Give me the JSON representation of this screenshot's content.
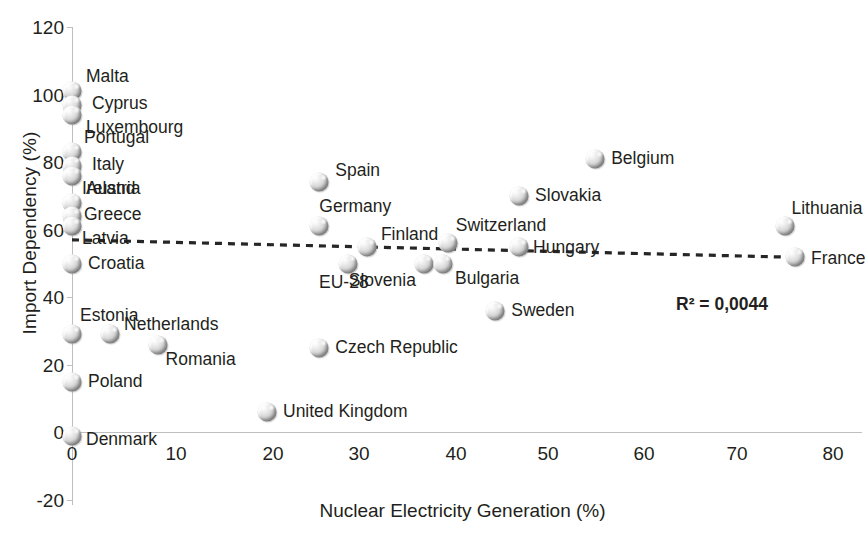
{
  "chart_data": {
    "type": "scatter",
    "title": "",
    "xlabel": "Nuclear Electricity Generation (%)",
    "ylabel": "Import Dependency (%)",
    "xlim": [
      0,
      80
    ],
    "ylim": [
      -20,
      120
    ],
    "xticks": [
      "0",
      "10",
      "20",
      "30",
      "40",
      "50",
      "60",
      "70",
      "80"
    ],
    "yticks": [
      "120",
      "100",
      "80",
      "60",
      "40",
      "20",
      "0",
      "-20"
    ],
    "grid": false,
    "legend": "none",
    "annotations": [
      {
        "name": "r-squared",
        "text": "R² = 0,0044",
        "x": 60.5,
        "y": 35
      }
    ],
    "trendline": {
      "style": "dashed",
      "color": "#262626",
      "x_start": 0.0,
      "y_start": 57.0,
      "x_end": 76.5,
      "y_end": 51.8
    },
    "points": [
      {
        "label": "Malta",
        "x": 0,
        "y": 101
      },
      {
        "label": "Cyprus",
        "x": 0,
        "y": 97
      },
      {
        "label": "Luxembourg",
        "x": 0,
        "y": 94
      },
      {
        "label": "Portugal",
        "x": 0,
        "y": 83
      },
      {
        "label": "Italy",
        "x": 0,
        "y": 79
      },
      {
        "label": "Ireland",
        "x": 0,
        "y": 76
      },
      {
        "label": "Austria",
        "x": 0,
        "y": 68
      },
      {
        "label": "Greece",
        "x": 0,
        "y": 64
      },
      {
        "label": "Latvia",
        "x": 0,
        "y": 61
      },
      {
        "label": "Croatia",
        "x": 0,
        "y": 50
      },
      {
        "label": "Estonia",
        "x": 0,
        "y": 29
      },
      {
        "label": "Poland",
        "x": 0,
        "y": 15
      },
      {
        "label": "Denmark",
        "x": 0,
        "y": -1
      },
      {
        "label": "Netherlands",
        "x": 4,
        "y": 29
      },
      {
        "label": "Romania",
        "x": 9,
        "y": 26
      },
      {
        "label": "United Kingdom",
        "x": 20.5,
        "y": 6
      },
      {
        "label": "Czech Republic",
        "x": 26,
        "y": 25
      },
      {
        "label": "Spain",
        "x": 26,
        "y": 74
      },
      {
        "label": "Germany",
        "x": 26,
        "y": 61
      },
      {
        "label": "EU-28",
        "x": 29,
        "y": 50
      },
      {
        "label": "Finland",
        "x": 31,
        "y": 55
      },
      {
        "label": "Slovenia",
        "x": 37,
        "y": 50
      },
      {
        "label": "Switzerland",
        "x": 39.5,
        "y": 56
      },
      {
        "label": "Bulgaria",
        "x": 39,
        "y": 50
      },
      {
        "label": "Sweden",
        "x": 44.5,
        "y": 36
      },
      {
        "label": "Hungary",
        "x": 47,
        "y": 55
      },
      {
        "label": "Slovakia",
        "x": 47,
        "y": 70
      },
      {
        "label": "Belgium",
        "x": 55,
        "y": 81
      },
      {
        "label": "Lithuania",
        "x": 75,
        "y": 61
      },
      {
        "label": "France",
        "x": 76,
        "y": 52
      }
    ]
  },
  "labels": {
    "malta": "Malta",
    "cyprus": "Cyprus",
    "luxembourg": "Luxembourg",
    "portugal": "Portugal",
    "italy": "Italy",
    "ireland": "Ireland",
    "austria": "Austria",
    "greece": "Greece",
    "latvia": "Latvia",
    "croatia": "Croatia",
    "estonia": "Estonia",
    "netherlands": "Netherlands",
    "romania": "Romania",
    "poland": "Poland",
    "denmark": "Denmark",
    "united_kingdom": "United Kingdom",
    "czech_republic": "Czech Republic",
    "spain": "Spain",
    "germany": "Germany",
    "eu28": "EU-28",
    "finland": "Finland",
    "slovenia": "Slovenia",
    "switzerland": "Switzerland",
    "bulgaria": "Bulgaria",
    "sweden": "Sweden",
    "hungary": "Hungary",
    "slovakia": "Slovakia",
    "belgium": "Belgium",
    "lithuania": "Lithuania",
    "france": "France"
  },
  "colors": {
    "axis": "#bfbfbf",
    "text": "#231f20",
    "trendline": "#262626",
    "marker_light": "#f2f2f2",
    "marker_dark": "#7a7a7a"
  }
}
